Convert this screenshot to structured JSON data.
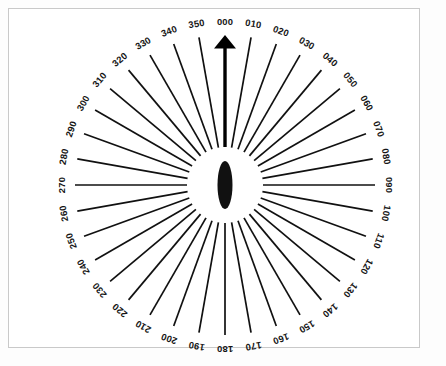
{
  "figure": {
    "type": "compass-rose",
    "caption": "",
    "center_marker": "lens-shaped-black-blob",
    "north_arrow_label": "000"
  },
  "chart_data": {
    "type": "scatter",
    "title": "",
    "subtitle": "",
    "xlabel": "",
    "ylabel": "",
    "grid": false,
    "legend_position": "none",
    "plot_style": "radial-ray-diagram",
    "center_x": 225,
    "center_y": 185,
    "inner_radius": 38,
    "outer_radius": 150,
    "label_radius": 164,
    "tick_interval_degrees": 10,
    "highlighted_bearing": "000",
    "categories": [
      "000",
      "010",
      "020",
      "030",
      "040",
      "050",
      "060",
      "070",
      "080",
      "090",
      "100",
      "110",
      "120",
      "130",
      "140",
      "150",
      "160",
      "170",
      "180",
      "190",
      "200",
      "210",
      "220",
      "230",
      "240",
      "250",
      "260",
      "270",
      "280",
      "290",
      "300",
      "310",
      "320",
      "330",
      "340",
      "350"
    ],
    "values": [
      150,
      150,
      150,
      150,
      150,
      150,
      150,
      150,
      150,
      150,
      150,
      150,
      150,
      150,
      150,
      150,
      150,
      150,
      150,
      150,
      150,
      150,
      150,
      150,
      150,
      150,
      150,
      150,
      150,
      150,
      150,
      150,
      150,
      150,
      150,
      150
    ],
    "angles_degrees": [
      0,
      10,
      20,
      30,
      40,
      50,
      60,
      70,
      80,
      90,
      100,
      110,
      120,
      130,
      140,
      150,
      160,
      170,
      180,
      190,
      200,
      210,
      220,
      230,
      240,
      250,
      260,
      270,
      280,
      290,
      300,
      310,
      320,
      330,
      340,
      350
    ],
    "ylim": [
      0,
      150
    ]
  },
  "colors": {
    "ray": "#111111",
    "arrow": "#000000",
    "label": "#151515",
    "frame": "#c9c9c9",
    "background": "#ffffff",
    "center_blob": "#111111"
  }
}
